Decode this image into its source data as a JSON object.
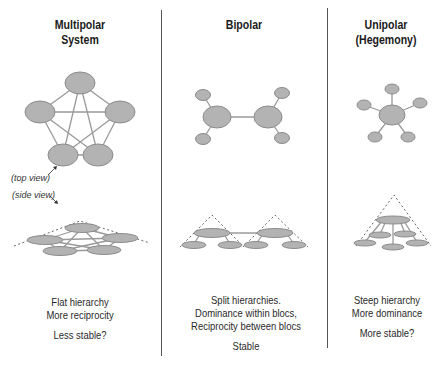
{
  "columns": [
    {
      "id": "multipolar",
      "title_line1": "Multipolar",
      "title_line2": "System",
      "caption_line1": "Flat hierarchy",
      "caption_line2": "More reciprocity",
      "stability": "Less stable?"
    },
    {
      "id": "bipolar",
      "title_line1": "Bipolar",
      "title_line2": "",
      "caption_line1": "Split hierarchies.",
      "caption_line2": "Dominance within blocs,",
      "caption_line3": "Reciprocity between blocs",
      "stability": "Stable"
    },
    {
      "id": "unipolar",
      "title_line1": "Unipolar",
      "title_line2": "(Hegemony)",
      "caption_line1": "Steep hierarchy",
      "caption_line2": "More dominance",
      "stability": "More stable?"
    }
  ],
  "labels": {
    "top_view": "(top view)",
    "side_view": "(side view)"
  },
  "colors": {
    "node_fill": "#b3b3b3",
    "node_stroke": "#8c8c8c",
    "edge": "#9a9a9a",
    "divider": "#555555"
  }
}
